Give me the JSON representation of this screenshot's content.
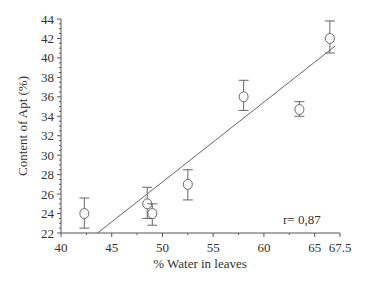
{
  "chart_data": {
    "type": "scatter",
    "title": "",
    "xlabel": "% Water in leaves",
    "ylabel": "Content of Apt (%)",
    "xlim": [
      40,
      67.5
    ],
    "ylim": [
      22,
      44
    ],
    "xticks": [
      40,
      45,
      50,
      55,
      60,
      65,
      67.5
    ],
    "xtick_labels": [
      "40",
      "45",
      "50",
      "55",
      "60",
      "65",
      "67.5"
    ],
    "yticks": [
      22,
      24,
      26,
      28,
      30,
      32,
      34,
      36,
      38,
      40,
      42,
      44
    ],
    "ytick_labels": [
      "22",
      "24",
      "26",
      "28",
      "30",
      "32",
      "34",
      "36",
      "38",
      "40",
      "42",
      "44"
    ],
    "grid": false,
    "legend": null,
    "series": [
      {
        "name": "Apt content",
        "marker": "open-circle",
        "points": [
          {
            "x": 42.3,
            "y": 24.0,
            "err_low": 22.5,
            "err_high": 25.6
          },
          {
            "x": 48.5,
            "y": 25.0,
            "err_low": 23.5,
            "err_high": 26.7
          },
          {
            "x": 49.0,
            "y": 24.0,
            "err_low": 22.8,
            "err_high": 25.0
          },
          {
            "x": 52.5,
            "y": 27.0,
            "err_low": 25.4,
            "err_high": 28.5
          },
          {
            "x": 58.0,
            "y": 36.0,
            "err_low": 34.6,
            "err_high": 37.7
          },
          {
            "x": 63.5,
            "y": 34.7,
            "err_low": 34.0,
            "err_high": 35.5
          },
          {
            "x": 66.5,
            "y": 42.0,
            "err_low": 40.5,
            "err_high": 43.8
          }
        ]
      }
    ],
    "regression_line": {
      "x_start": 43.6,
      "y_start": 22.0,
      "x_end": 67.0,
      "y_end": 41.2
    },
    "annotations": [
      {
        "text": "r= 0,87",
        "x": 63.5,
        "y": 23.5
      }
    ]
  },
  "labels": {
    "xlabel": "% Water in leaves",
    "ylabel": "Content of Apt (%)",
    "r_value": "r= 0,87"
  }
}
